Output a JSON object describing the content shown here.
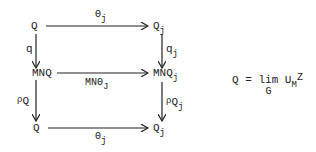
{
  "diagram": {
    "nodes": {
      "top_left": {
        "base": "Q",
        "sub": ""
      },
      "top_right": {
        "base": "Q",
        "sub": "j"
      },
      "mid_left": {
        "base": "MNQ",
        "sub": ""
      },
      "mid_right": {
        "base": "MNQ",
        "sub": "j"
      },
      "bot_left": {
        "base": "Q",
        "sub": ""
      },
      "bot_right": {
        "base": "Q",
        "sub": "j"
      }
    },
    "arrows": {
      "top_horizontal": {
        "base": "Θ",
        "sub": "j"
      },
      "mid_horizontal": {
        "base": "MNΘ",
        "sub": "J"
      },
      "bot_horizontal": {
        "base": "Θ",
        "sub": "j"
      },
      "left_upper": {
        "base": "q",
        "sub": ""
      },
      "left_lower": {
        "base": "ρ",
        "sub": "Q"
      },
      "right_upper": {
        "base": "q",
        "sub": "j"
      },
      "right_lower": {
        "base": "ρ",
        "sub": "Q",
        "subsub": "j"
      }
    },
    "equation": {
      "lhs": "Q",
      "eq": "=",
      "op": "lim",
      "op_sub": "G",
      "rhs_base": "U",
      "rhs_sub": "M",
      "rhs_sup": "Z"
    }
  }
}
